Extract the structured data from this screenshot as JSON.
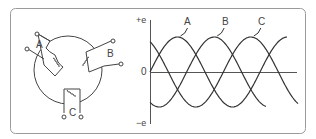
{
  "figure": {
    "frame_color": "#9a9a9a",
    "line_color": "#444444"
  },
  "generator": {
    "windings": [
      {
        "label": "A"
      },
      {
        "label": "B"
      },
      {
        "label": "C"
      }
    ]
  },
  "graph": {
    "y_top_label": "+e",
    "y_zero_label": "0",
    "y_bottom_label": "−e",
    "curves": [
      {
        "label": "A",
        "phase_deg": 0
      },
      {
        "label": "B",
        "phase_deg": 120
      },
      {
        "label": "C",
        "phase_deg": 240
      }
    ]
  }
}
